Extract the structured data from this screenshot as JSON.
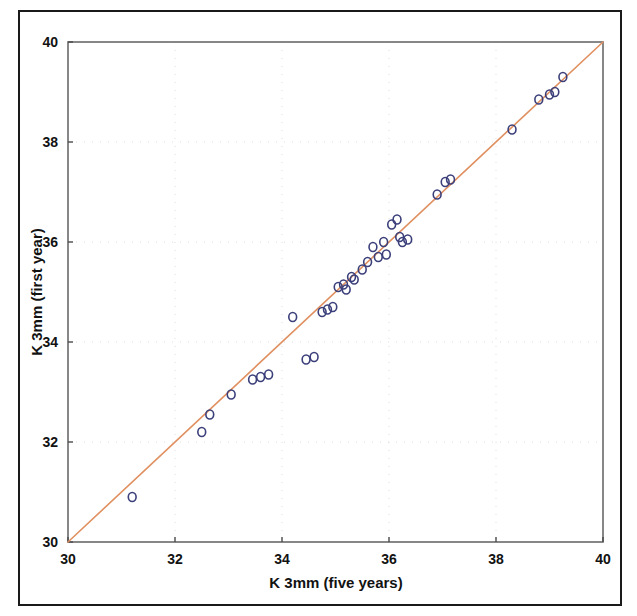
{
  "figure": {
    "border_color": "#1a1a1a",
    "background": "#ffffff"
  },
  "chart_data": {
    "type": "scatter",
    "title": "",
    "xlabel": "K 3mm (five years)",
    "ylabel": "K 3mm (first year)",
    "xlim": [
      30,
      40
    ],
    "ylim": [
      30,
      40
    ],
    "xticks": [
      30,
      32,
      34,
      36,
      38,
      40
    ],
    "yticks": [
      30,
      32,
      34,
      36,
      38,
      40
    ],
    "xtick_labels": [
      "30",
      "32",
      "34",
      "36",
      "38",
      "40"
    ],
    "ytick_labels": [
      "30",
      "32",
      "34",
      "36",
      "38",
      "40"
    ],
    "grid": true,
    "grid_style": "faint-dotted",
    "legend": null,
    "marker": {
      "shape": "open-circle",
      "edge_color": "#3b3f7a",
      "face_color": "none",
      "size_px": 9,
      "edge_width": 1.6
    },
    "reference_line": {
      "name": "identity-line",
      "type": "line",
      "color": "#e09060",
      "width": 1.6,
      "x": [
        30,
        40
      ],
      "y": [
        30,
        40
      ],
      "description": "y = x identity / regression line"
    },
    "series": [
      {
        "name": "K readings first year vs five years",
        "color": "#3b3f7a",
        "points": [
          [
            31.2,
            30.9
          ],
          [
            32.5,
            32.2
          ],
          [
            32.65,
            32.55
          ],
          [
            33.05,
            32.95
          ],
          [
            33.45,
            33.25
          ],
          [
            33.6,
            33.3
          ],
          [
            33.75,
            33.35
          ],
          [
            34.2,
            34.5
          ],
          [
            34.45,
            33.65
          ],
          [
            34.6,
            33.7
          ],
          [
            34.75,
            34.6
          ],
          [
            34.85,
            34.65
          ],
          [
            34.95,
            34.7
          ],
          [
            35.05,
            35.1
          ],
          [
            35.15,
            35.15
          ],
          [
            35.2,
            35.05
          ],
          [
            35.3,
            35.3
          ],
          [
            35.35,
            35.25
          ],
          [
            35.5,
            35.45
          ],
          [
            35.6,
            35.6
          ],
          [
            35.7,
            35.9
          ],
          [
            35.8,
            35.7
          ],
          [
            35.9,
            36.0
          ],
          [
            35.95,
            35.75
          ],
          [
            36.05,
            36.35
          ],
          [
            36.15,
            36.45
          ],
          [
            36.2,
            36.1
          ],
          [
            36.25,
            36.0
          ],
          [
            36.35,
            36.05
          ],
          [
            36.9,
            36.95
          ],
          [
            37.05,
            37.2
          ],
          [
            37.15,
            37.25
          ],
          [
            38.3,
            38.25
          ],
          [
            38.8,
            38.85
          ],
          [
            39.0,
            38.95
          ],
          [
            39.1,
            39.0
          ],
          [
            39.25,
            39.3
          ]
        ]
      }
    ]
  }
}
